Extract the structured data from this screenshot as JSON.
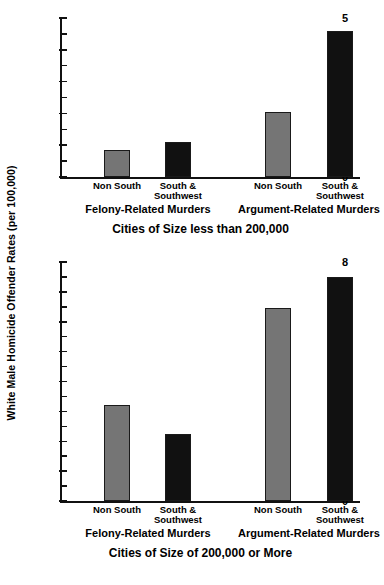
{
  "figure": {
    "ylabel": "White Male Homicide Offender Rates (per 100,000)",
    "bar_color_nonsouth": "#757575",
    "bar_color_south": "#111111"
  },
  "chart_data": [
    {
      "type": "bar",
      "title": "Cities of Size less than 200,000",
      "xlabel": "",
      "ylabel": "White Male Homicide Offender Rates (per 100,000)",
      "ylim": [
        0,
        5
      ],
      "ytick_labels": [
        "0",
        "1",
        "2",
        "3",
        "4",
        "5"
      ],
      "yticks": [
        0,
        1,
        2,
        3,
        4,
        5
      ],
      "yminor_ticks": [
        0.5,
        1.5,
        2.5,
        3.5,
        4.5
      ],
      "grid": false,
      "legend": "none",
      "groups": [
        "Felony-Related Murders",
        "Argument-Related Murders"
      ],
      "categories": [
        "Non South",
        "South &\nSouthwest",
        "Non South",
        "South &\nSouthwest"
      ],
      "values": [
        0.85,
        1.1,
        2.06,
        4.6
      ],
      "bars": [
        {
          "group": "Felony-Related Murders",
          "category": "Non South",
          "value": 0.85,
          "color": "#757575"
        },
        {
          "group": "Felony-Related Murders",
          "category": "South &\nSouthwest",
          "value": 1.1,
          "color": "#111111"
        },
        {
          "group": "Argument-Related Murders",
          "category": "Non South",
          "value": 2.06,
          "color": "#757575"
        },
        {
          "group": "Argument-Related Murders",
          "category": "South &\nSouthwest",
          "value": 4.6,
          "color": "#111111"
        }
      ]
    },
    {
      "type": "bar",
      "title": "Cities of Size of 200,000 or More",
      "xlabel": "",
      "ylabel": "White Male Homicide Offender Rates (per 100,000)",
      "ylim": [
        0,
        8
      ],
      "ytick_labels": [
        "0",
        "1",
        "2",
        "3",
        "4",
        "5",
        "6",
        "7",
        "8"
      ],
      "yticks": [
        0,
        1,
        2,
        3,
        4,
        5,
        6,
        7,
        8
      ],
      "yminor_ticks": [
        0.5,
        1.5,
        2.5,
        3.5,
        4.5,
        5.5,
        6.5,
        7.5
      ],
      "grid": false,
      "legend": "none",
      "groups": [
        "Felony-Related Murders",
        "Argument-Related Murders"
      ],
      "categories": [
        "Non South",
        "South &\nSouthwest",
        "Non South",
        "South &\nSouthwest"
      ],
      "values": [
        3.2,
        2.25,
        6.45,
        7.5
      ],
      "bars": [
        {
          "group": "Felony-Related Murders",
          "category": "Non South",
          "value": 3.2,
          "color": "#757575"
        },
        {
          "group": "Felony-Related Murders",
          "category": "South &\nSouthwest",
          "value": 2.25,
          "color": "#111111"
        },
        {
          "group": "Argument-Related Murders",
          "category": "Non South",
          "value": 6.45,
          "color": "#757575"
        },
        {
          "group": "Argument-Related Murders",
          "category": "South &\nSouthwest",
          "value": 7.5,
          "color": "#111111"
        }
      ]
    }
  ]
}
